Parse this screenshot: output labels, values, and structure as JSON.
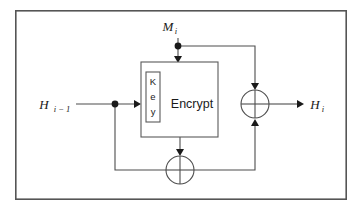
{
  "figure": {
    "name": "hash-round-function-diagram",
    "type": "block-diagram",
    "frame": {
      "visible": true,
      "color": "#555555",
      "x": 15,
      "y": 10,
      "width": 332,
      "height": 190
    },
    "background_color": "#ffffff",
    "line_color": "#4d4d4d"
  },
  "labels": {
    "message_input": {
      "base": "M",
      "subscript": "i",
      "text": "M i",
      "x": 172,
      "y": 30
    },
    "chain_input": {
      "base": "H",
      "subscript": "i − 1",
      "text": "H i − 1",
      "x": 40,
      "y": 108
    },
    "chain_output": {
      "base": "H",
      "subscript": "i",
      "text": "H i",
      "x": 312,
      "y": 108
    },
    "encrypt_block": {
      "text": "Encrypt",
      "x": 178,
      "y": 104
    },
    "key_block": {
      "text": "Key",
      "letters": [
        "K",
        "e",
        "y"
      ],
      "orientation": "vertical-stacked"
    }
  },
  "blocks": [
    {
      "id": "encrypt",
      "label": "Encrypt",
      "x": 141,
      "y": 62,
      "width": 77,
      "height": 75
    },
    {
      "id": "key",
      "label": "Key",
      "x": 146,
      "y": 72,
      "width": 14,
      "height": 50
    }
  ],
  "operators": [
    {
      "id": "xor-bottom",
      "symbol": "⊕",
      "name": "xor-gate-bottom",
      "cx": 180,
      "cy": 170,
      "r": 14
    },
    {
      "id": "xor-right",
      "symbol": "⊕",
      "name": "xor-gate-right",
      "cx": 255,
      "cy": 104,
      "r": 14
    }
  ],
  "junctions": [
    {
      "id": "junction-message",
      "cx": 178,
      "cy": 46
    },
    {
      "id": "junction-chain",
      "cx": 115,
      "cy": 104
    }
  ],
  "connections": [
    {
      "from": "message_input",
      "to": "encrypt-top",
      "label": "M i into plaintext input"
    },
    {
      "from": "junction-message",
      "to": "xor-right-top",
      "label": "M i into right XOR"
    },
    {
      "from": "chain_input",
      "to": "key-block",
      "label": "H i-1 into key input"
    },
    {
      "from": "junction-chain",
      "to": "xor-bottom-left",
      "label": "H i-1 into bottom XOR"
    },
    {
      "from": "encrypt-bottom",
      "to": "xor-bottom-top",
      "label": "ciphertext into bottom XOR"
    },
    {
      "from": "xor-bottom-right",
      "to": "xor-right-bottom",
      "label": "bottom XOR into right XOR"
    },
    {
      "from": "xor-right-right",
      "to": "chain_output",
      "label": "right XOR to H i"
    }
  ]
}
